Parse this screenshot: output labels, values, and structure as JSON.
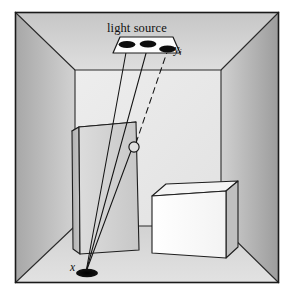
{
  "figure": {
    "domain": "Diagram",
    "title_text": "light source"
  },
  "labels": {
    "light_source": "light source",
    "yi_base": "y",
    "yi_sub": "i",
    "x_point": "x"
  },
  "colors": {
    "border": "#1a1a1a",
    "back_wall": "#e9e9e9",
    "left_wall_light": "#cfcfcf",
    "left_wall_dark": "#a9a9a9",
    "right_wall_light": "#cdcdcd",
    "right_wall_dark": "#9e9e9e",
    "floor": "#dcdcdc",
    "ceiling": "#d6d6d6",
    "tall_box_front": "#d2d2d2",
    "tall_box_side": "#bdbdbd",
    "tall_box_top": "#e4e4e4",
    "cube_front": "#fbfbfb",
    "cube_top": "#f2f2f2",
    "cube_side": "#bcbcbc",
    "lamp_fill": "#0d0d0d",
    "fixture_fill": "#fdfdfd",
    "ray_stroke": "#141414",
    "point_fill": "#0a0a0a"
  },
  "geometry": {
    "canvas": {
      "width": 294,
      "height": 299
    },
    "frame": {
      "x": 15,
      "y": 12,
      "width": 264,
      "height": 271
    },
    "back_wall": {
      "left": 75,
      "top": 70,
      "right": 221,
      "bottom": 226
    },
    "light_point_x": {
      "cx": 86,
      "cy": 273,
      "rx": 11,
      "ry": 4.2
    },
    "fixture": {
      "front_left": 113,
      "front_right": 179,
      "front_y": 52,
      "back_left": 120,
      "back_right": 172,
      "back_y": 38
    },
    "lamps": [
      {
        "cx": 127,
        "cy": 45,
        "rx": 8.5,
        "ry": 3.6
      },
      {
        "cx": 148,
        "cy": 44,
        "rx": 8.5,
        "ry": 3.6
      },
      {
        "cx": 167,
        "cy": 49,
        "rx": 8.5,
        "ry": 3.6
      }
    ],
    "occlusion_marker": {
      "cx": 134,
      "cy": 147,
      "r": 5.2
    },
    "rays": [
      {
        "kind": "solid",
        "from": [
          86,
          273
        ],
        "to": [
          127,
          47
        ]
      },
      {
        "kind": "solid",
        "from": [
          86,
          273
        ],
        "to": [
          148,
          46
        ]
      },
      {
        "kind": "solid",
        "from": [
          86,
          273
        ],
        "to": [
          131,
          150
        ]
      },
      {
        "kind": "dashed",
        "from": [
          136,
          144
        ],
        "to": [
          166,
          51
        ]
      }
    ],
    "tall_box": {
      "front": [
        [
          79,
          127
        ],
        [
          136,
          122
        ],
        [
          139,
          250
        ],
        [
          80,
          254
        ]
      ],
      "side": [
        [
          72,
          131
        ],
        [
          79,
          127
        ],
        [
          80,
          254
        ],
        [
          73,
          250
        ]
      ],
      "top": [
        [
          72,
          131
        ],
        [
          130,
          126
        ],
        [
          136,
          122
        ],
        [
          79,
          127
        ]
      ]
    },
    "cube": {
      "front": [
        [
          152,
          196
        ],
        [
          226,
          191
        ],
        [
          226,
          258
        ],
        [
          152,
          253
        ]
      ],
      "top": [
        [
          152,
          196
        ],
        [
          166,
          184
        ],
        [
          238,
          181
        ],
        [
          226,
          191
        ]
      ],
      "side": [
        [
          226,
          191
        ],
        [
          238,
          181
        ],
        [
          238,
          248
        ],
        [
          226,
          258
        ]
      ]
    }
  },
  "scene_elements": [
    {
      "name": "room-box",
      "type": "enclosure"
    },
    {
      "name": "ceiling-light-fixture",
      "type": "light-source",
      "lamp_count": 3
    },
    {
      "name": "tall-box",
      "type": "occluder"
    },
    {
      "name": "cube",
      "type": "object"
    },
    {
      "name": "shading-point",
      "type": "sample-point",
      "label": "x"
    },
    {
      "name": "light-sample",
      "type": "sample-point",
      "label": "yi"
    }
  ]
}
